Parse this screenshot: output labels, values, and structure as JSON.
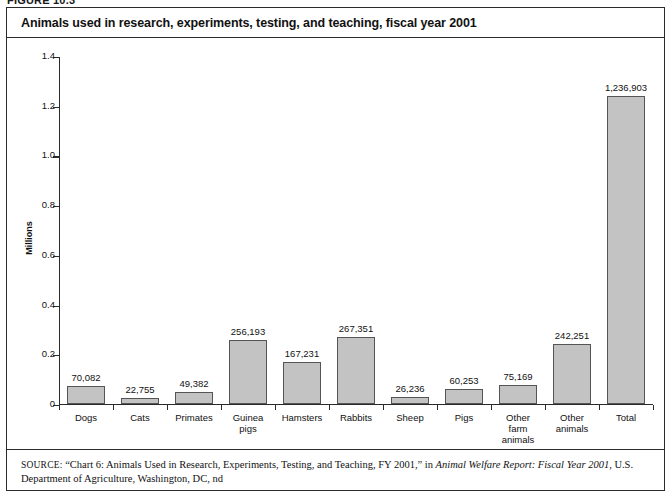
{
  "figure": {
    "number": "FIGURE 10.3",
    "title": "Animals used in research, experiments, testing, and teaching, fiscal year 2001"
  },
  "source": {
    "label": "SOURCE:",
    "text_before_italic": " “Chart 6: Animals Used in Research, Experiments, Testing, and Teaching, FY 2001,” in ",
    "italic_title": "Animal Welfare Report: Fiscal Year 2001",
    "text_after_italic": ", U.S. Department of Agriculture, Washington, DC, nd"
  },
  "chart_data": {
    "type": "bar",
    "title": "Animals used in research, experiments, testing, and teaching, fiscal year 2001",
    "xlabel": "",
    "ylabel": "Millions",
    "ylim": [
      0,
      1.4
    ],
    "yticks": [
      "0",
      "0.2",
      "0.4",
      "0.6",
      "0.8",
      "1.0",
      "1.2",
      "1.4"
    ],
    "ytick_values": [
      0,
      0.2,
      0.4,
      0.6,
      0.8,
      1.0,
      1.2,
      1.4
    ],
    "grid": false,
    "legend": "none",
    "units": "millions of animals",
    "categories": [
      "Dogs",
      "Cats",
      "Primates",
      "Guinea pigs",
      "Hamsters",
      "Rabbits",
      "Sheep",
      "Pigs",
      "Other farm animals",
      "Other animals",
      "Total"
    ],
    "category_lines": [
      [
        "Dogs"
      ],
      [
        "Cats"
      ],
      [
        "Primates"
      ],
      [
        "Guinea",
        "pigs"
      ],
      [
        "Hamsters"
      ],
      [
        "Rabbits"
      ],
      [
        "Sheep"
      ],
      [
        "Pigs"
      ],
      [
        "Other",
        "farm",
        "animals"
      ],
      [
        "Other",
        "animals"
      ],
      [
        "Total"
      ]
    ],
    "values": [
      70082,
      22755,
      49382,
      256193,
      167231,
      267351,
      26236,
      60253,
      75169,
      242251,
      1236903
    ],
    "values_millions": [
      0.070082,
      0.022755,
      0.049382,
      0.256193,
      0.167231,
      0.267351,
      0.026236,
      0.060253,
      0.075169,
      0.242251,
      1.236903
    ],
    "data_labels": [
      "70,082",
      "22,755",
      "49,382",
      "256,193",
      "167,231",
      "267,351",
      "26,236",
      "60,253",
      "75,169",
      "242,251",
      "1,236,903"
    ],
    "bar_color": "#c3c3c3",
    "bar_edge_color": "#555555",
    "axis_color": "#2b2b2b",
    "background_color": "#ffffff"
  }
}
